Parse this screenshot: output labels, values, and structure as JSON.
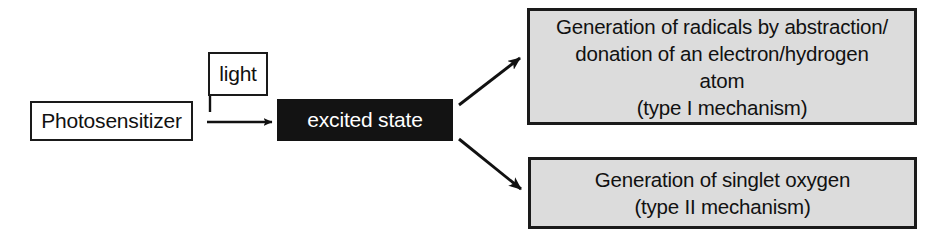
{
  "diagram": {
    "background_color": "#ffffff",
    "nodes": {
      "photosensitizer": {
        "label": "Photosensitizer",
        "fill": "#ffffff",
        "text_color": "#111111",
        "border_color": "#1a1a1a"
      },
      "light": {
        "label": "light",
        "fill": "#ffffff",
        "text_color": "#111111",
        "border_color": "#1a1a1a"
      },
      "excited_state": {
        "label": "excited state",
        "fill": "#131313",
        "text_color": "#ffffff",
        "border_color": "#131313"
      },
      "type_i": {
        "fill": "#dcdcdc",
        "text_color": "#111111",
        "border_color": "#1a1a1a",
        "lines": [
          "Generation of radicals by abstraction/",
          "donation of an electron/hydrogen",
          "atom",
          "(type I mechanism)"
        ]
      },
      "type_ii": {
        "fill": "#dcdcdc",
        "text_color": "#111111",
        "border_color": "#1a1a1a",
        "lines": [
          "Generation of singlet oxygen",
          "(type II mechanism)"
        ]
      }
    },
    "connectors": [
      {
        "name": "photosensitizer-to-excited-state",
        "from": "photosensitizer",
        "to": "excited_state",
        "style": "solid-arrow",
        "direction": "right"
      },
      {
        "name": "light-to-excited-state",
        "from": "light",
        "to": "excited_state",
        "style": "drop-line",
        "direction": "down"
      },
      {
        "name": "excited-state-to-type-i",
        "from": "excited_state",
        "to": "type_i",
        "style": "solid-arrow",
        "direction": "up-right"
      },
      {
        "name": "excited-state-to-type-ii",
        "from": "excited_state",
        "to": "type_ii",
        "style": "solid-arrow",
        "direction": "down-right"
      }
    ]
  }
}
